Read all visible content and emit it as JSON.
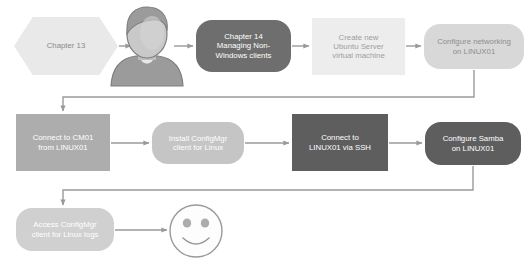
{
  "diagram": {
    "canvas": {
      "width": 530,
      "height": 267,
      "background": "#ffffff"
    },
    "palette": {
      "hex_fill": "#E9E9E9",
      "very_light": "#EDEDED",
      "light": "#D8D8D8",
      "light_medium": "#C5C5C5",
      "medium": "#ADADAD",
      "dark": "#6E6E6E",
      "darker": "#5E5E5E",
      "connector": "#9A9A9A",
      "text_dark": "#7A7A7A",
      "text_light": "#FFFFFF",
      "person_icon": "#9B9B9B",
      "smiley_stroke": "#9A9A9A"
    },
    "nodes": [
      {
        "id": "chapter-13",
        "label": "Chapter 13",
        "shape": "hexagon",
        "fill": "#E9E9E9",
        "text_color": "#8A8A8A",
        "font_size": 7.8,
        "x": 14,
        "y": 17,
        "w": 104,
        "h": 58
      },
      {
        "id": "chapter-14",
        "label": "Chapter 14\nManaging Non-\nWindows clients",
        "shape": "rounded",
        "fill": "#6E6E6E",
        "text_color": "#FFFFFF",
        "font_size": 7.8,
        "x": 196,
        "y": 20,
        "w": 95,
        "h": 52
      },
      {
        "id": "create-ubuntu-vm",
        "label": "Create new\nUbuntu Server\nvirtual machine",
        "shape": "rect",
        "fill": "#EDEDED",
        "text_color": "#9E9E9E",
        "font_size": 7.8,
        "x": 312,
        "y": 18,
        "w": 93,
        "h": 57
      },
      {
        "id": "configure-networking",
        "label": "Configure networking\non LINUX01",
        "shape": "rounded",
        "fill": "#D8D8D8",
        "text_color": "#8E8E8E",
        "font_size": 7.8,
        "x": 424,
        "y": 24,
        "w": 100,
        "h": 45
      },
      {
        "id": "connect-cm01",
        "label": "Connect to CM01\nfrom LINUX01",
        "shape": "rect",
        "fill": "#ADADAD",
        "text_color": "#FFFFFF",
        "font_size": 7.8,
        "x": 16,
        "y": 114,
        "w": 94,
        "h": 57
      },
      {
        "id": "install-configmgr-client",
        "label": "Install ConfigMgr\nclient  for Linux",
        "shape": "rounded",
        "fill": "#C5C5C5",
        "text_color": "#FFFFFF",
        "font_size": 7.8,
        "x": 152,
        "y": 122,
        "w": 92,
        "h": 42
      },
      {
        "id": "connect-ssh",
        "label": "Connect to\nLINUX01 via SSH",
        "shape": "rect",
        "fill": "#5E5E5E",
        "text_color": "#FFFFFF",
        "font_size": 7.8,
        "x": 292,
        "y": 114,
        "w": 96,
        "h": 57
      },
      {
        "id": "configure-samba",
        "label": "Configure Samba\non LINUX01",
        "shape": "rounded",
        "fill": "#5E5E5E",
        "text_color": "#FFFFFF",
        "font_size": 7.8,
        "x": 425,
        "y": 122,
        "w": 96,
        "h": 43
      },
      {
        "id": "access-logs",
        "label": "Access ConfigMgr\nclient for Linux logs",
        "shape": "rounded",
        "fill": "#D0D0D0",
        "text_color": "#FFFFFF",
        "font_size": 7.8,
        "x": 16,
        "y": 208,
        "w": 98,
        "h": 43
      }
    ],
    "figures": [
      {
        "id": "person-icon",
        "name": "person-icon",
        "x": 113,
        "y": 6,
        "w": 70,
        "h": 80
      },
      {
        "id": "smiley-icon",
        "name": "smiley-face-icon",
        "cx": 196,
        "cy": 231,
        "r": 26
      }
    ],
    "connectors": [
      {
        "id": "c1",
        "from": "chapter-13",
        "to": "person-icon",
        "type": "arrow-right"
      },
      {
        "id": "c2",
        "from": "person-icon",
        "to": "chapter-14",
        "type": "arrow-right"
      },
      {
        "id": "c3",
        "from": "chapter-14",
        "to": "create-ubuntu-vm",
        "type": "arrow-right"
      },
      {
        "id": "c4",
        "from": "create-ubuntu-vm",
        "to": "configure-networking",
        "type": "arrow-right"
      },
      {
        "id": "c5",
        "from": "configure-networking",
        "to": "connect-cm01",
        "type": "elbow-down-left"
      },
      {
        "id": "c6",
        "from": "connect-cm01",
        "to": "install-configmgr-client",
        "type": "arrow-right"
      },
      {
        "id": "c7",
        "from": "install-configmgr-client",
        "to": "connect-ssh",
        "type": "arrow-right"
      },
      {
        "id": "c8",
        "from": "connect-ssh",
        "to": "configure-samba",
        "type": "arrow-right"
      },
      {
        "id": "c9",
        "from": "configure-samba",
        "to": "access-logs",
        "type": "elbow-down-left"
      },
      {
        "id": "c10",
        "from": "access-logs",
        "to": "smiley-icon",
        "type": "arrow-right"
      }
    ]
  }
}
